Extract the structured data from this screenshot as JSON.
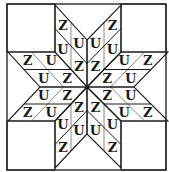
{
  "diagram": {
    "type": "eight-point-star-quilt-block",
    "colors": {
      "background": "#ffffff",
      "outline": "#1a1a1a",
      "subdivision": "#888888",
      "label": "#1a1a1a"
    },
    "outer_square": {
      "x1": 7,
      "y1": 4,
      "x2": 166,
      "y2": 170
    },
    "center": [
      87,
      87
    ],
    "center_dot": true,
    "corner_squares": [
      {
        "name": "top-left",
        "points": [
          [
            7,
            4
          ],
          [
            55,
            4
          ],
          [
            55,
            52
          ],
          [
            7,
            52
          ]
        ]
      },
      {
        "name": "top-right",
        "points": [
          [
            121,
            4
          ],
          [
            166,
            4
          ],
          [
            166,
            52
          ],
          [
            121,
            52
          ]
        ]
      },
      {
        "name": "bottom-left",
        "points": [
          [
            7,
            121
          ],
          [
            55,
            121
          ],
          [
            55,
            170
          ],
          [
            7,
            170
          ]
        ]
      },
      {
        "name": "bottom-right",
        "points": [
          [
            121,
            121
          ],
          [
            166,
            121
          ],
          [
            166,
            170
          ],
          [
            121,
            170
          ]
        ]
      }
    ],
    "diamonds": [
      {
        "name": "top-left",
        "p1": [
          55,
          52
        ],
        "p3": [
          87,
          40
        ],
        "labels": {
          "inner": "Z",
          "side_a": "U",
          "side_b": "U",
          "outer": "Z"
        }
      },
      {
        "name": "top-right",
        "p1": [
          121,
          52
        ],
        "p3": [
          87,
          40
        ],
        "labels": {
          "inner": "Z",
          "side_a": "U",
          "side_b": "U",
          "outer": "Z"
        }
      },
      {
        "name": "left-upper",
        "p1": [
          40,
          87
        ],
        "p3": [
          55,
          52
        ],
        "labels": {
          "inner": "Z",
          "side_a": "U",
          "side_b": "U",
          "outer": "Z"
        }
      },
      {
        "name": "left-lower",
        "p1": [
          40,
          87
        ],
        "p3": [
          55,
          121
        ],
        "labels": {
          "inner": "Z",
          "side_a": "U",
          "side_b": "U",
          "outer": "Z"
        }
      },
      {
        "name": "right-upper",
        "p1": [
          134,
          87
        ],
        "p3": [
          121,
          52
        ],
        "labels": {
          "inner": "Z",
          "side_a": "U",
          "side_b": "U",
          "outer": "Z"
        }
      },
      {
        "name": "right-lower",
        "p1": [
          134,
          87
        ],
        "p3": [
          121,
          121
        ],
        "labels": {
          "inner": "Z",
          "side_a": "U",
          "side_b": "U",
          "outer": "Z"
        }
      },
      {
        "name": "bottom-left",
        "p1": [
          55,
          121
        ],
        "p3": [
          87,
          134
        ],
        "labels": {
          "inner": "Z",
          "side_a": "U",
          "side_b": "U",
          "outer": "Z"
        }
      },
      {
        "name": "bottom-right",
        "p1": [
          121,
          121
        ],
        "p3": [
          87,
          134
        ],
        "labels": {
          "inner": "Z",
          "side_a": "U",
          "side_b": "U",
          "outer": "Z"
        }
      }
    ],
    "label_set": [
      "Z",
      "U"
    ]
  }
}
